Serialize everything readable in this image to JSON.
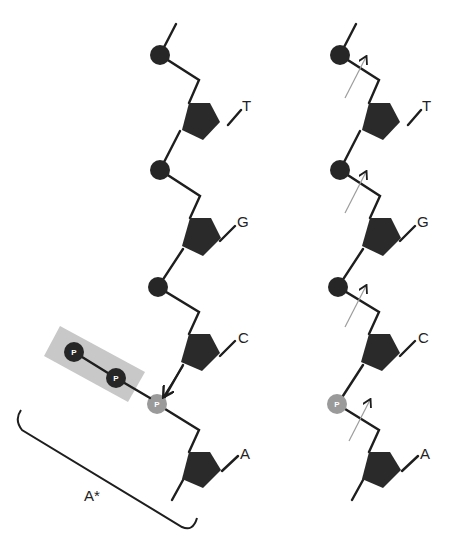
{
  "figure": {
    "left_strand": {
      "bases": [
        "T",
        "G",
        "C",
        "A"
      ],
      "phosphate_label": "P",
      "pyrophosphate_labels": [
        "P",
        "P"
      ],
      "incoming_label": "A*"
    },
    "right_strand": {
      "bases": [
        "T",
        "G",
        "C",
        "A"
      ],
      "phosphate_label": "P"
    },
    "colors": {
      "backbone": "#1e1e1e",
      "sugar": "#2a2a2a",
      "phosphate": "#262626",
      "new_phosphate": "#9a9a9a",
      "pyrophosphate_box": "#c8c8c8",
      "arrows": "#9c9c9c"
    }
  }
}
